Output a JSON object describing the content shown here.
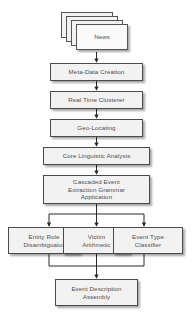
{
  "diagram": {
    "type": "flowchart",
    "background_color": "#ffffff",
    "node_fill_color": "#f2f2f2",
    "node_border_color": "#4a4a4a",
    "text_color": "#4d4d4d",
    "connector_color": "#2b2b2b",
    "nodes": [
      {
        "id": "news",
        "label": "News",
        "shape": "multi-document"
      },
      {
        "id": "meta_data_creation",
        "label": "Meta-Data Creation",
        "shape": "rect"
      },
      {
        "id": "real_time_clusterer",
        "label": "Real Time Clusterer",
        "shape": "rect"
      },
      {
        "id": "geo_locating",
        "label": "Geo-Locating",
        "shape": "rect"
      },
      {
        "id": "core_linguistic_analysis",
        "label": "Core Linguistic Analysis",
        "shape": "rect"
      },
      {
        "id": "cascaded_event_extraction",
        "label": "Cascaded Event\nExtraction  Grammar\nApplication",
        "shape": "rect"
      },
      {
        "id": "entity_role_disambiguator",
        "label": "Entity Role\nDisambiguator",
        "shape": "rect"
      },
      {
        "id": "victim_arithmetic",
        "label": "Victim\nArithmetic",
        "shape": "rect"
      },
      {
        "id": "event_type_classifier",
        "label": "Event Type\nClassifier",
        "shape": "rect"
      },
      {
        "id": "event_description_assembly",
        "label": "Event Description\nAssembly",
        "shape": "rect"
      }
    ],
    "edges": [
      {
        "from": "news",
        "to": "meta_data_creation"
      },
      {
        "from": "meta_data_creation",
        "to": "real_time_clusterer"
      },
      {
        "from": "real_time_clusterer",
        "to": "geo_locating"
      },
      {
        "from": "geo_locating",
        "to": "core_linguistic_analysis"
      },
      {
        "from": "core_linguistic_analysis",
        "to": "cascaded_event_extraction"
      },
      {
        "from": "cascaded_event_extraction",
        "to": "entity_role_disambiguator"
      },
      {
        "from": "cascaded_event_extraction",
        "to": "victim_arithmetic"
      },
      {
        "from": "cascaded_event_extraction",
        "to": "event_type_classifier"
      },
      {
        "from": "entity_role_disambiguator",
        "to": "event_description_assembly"
      },
      {
        "from": "victim_arithmetic",
        "to": "event_description_assembly"
      },
      {
        "from": "event_type_classifier",
        "to": "event_description_assembly"
      }
    ]
  }
}
